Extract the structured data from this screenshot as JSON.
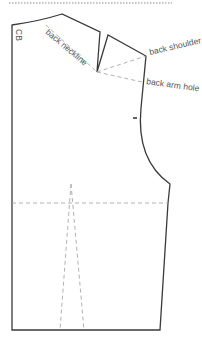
{
  "diagram": {
    "labels": {
      "cb": "CB",
      "back_neckline": "back neckline",
      "back_shoulder": "back shoulder",
      "back_arm_hole": "back arm hole"
    },
    "colors": {
      "outline": "#3a3a3a",
      "guide": "#a8a8a8",
      "text": "#555555",
      "background": "#ffffff"
    }
  }
}
